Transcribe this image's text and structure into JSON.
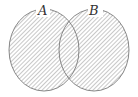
{
  "diagram": {
    "type": "venn",
    "shaded_region": "A ∪ B",
    "sets": [
      {
        "label": "A",
        "cx": 44,
        "cy": 50,
        "rx": 35,
        "ry": 41
      },
      {
        "label": "B",
        "cx": 94,
        "cy": 50,
        "rx": 35,
        "ry": 41
      }
    ],
    "colors": {
      "outline": "#7a7a7a",
      "hatch": "#9a9a9a",
      "background": "#ffffff",
      "label": "#333333"
    }
  }
}
